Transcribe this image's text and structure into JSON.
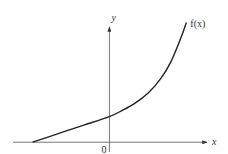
{
  "chart_data": {
    "type": "line",
    "title": "",
    "xlabel": "x",
    "ylabel": "y",
    "origin_label": "0",
    "series": [
      {
        "name": "f(x)",
        "label": "f(x)",
        "shape": "increasing, convex; near-linear for x<0, rising steeply on the right",
        "x": [
          -3.0,
          -2.0,
          -1.0,
          0.0,
          0.5,
          1.0,
          1.5,
          2.0,
          2.4,
          2.8,
          3.0
        ],
        "y": [
          0.0,
          0.35,
          0.7,
          1.05,
          1.3,
          1.6,
          2.0,
          2.6,
          3.3,
          4.3,
          4.9
        ]
      }
    ],
    "xlim": [
      -3.8,
      4.0
    ],
    "ylim": [
      -0.4,
      5.0
    ],
    "ticks": {
      "x": [
        "0"
      ],
      "y": []
    },
    "grid": false,
    "legend": "none",
    "annotations": [
      "f(x) label at upper end of curve"
    ]
  }
}
